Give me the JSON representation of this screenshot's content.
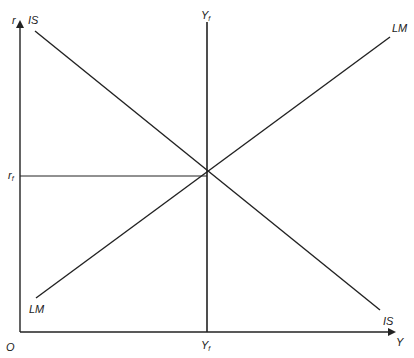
{
  "diagram": {
    "type": "IS-LM diagram",
    "axes": {
      "y_label": "r",
      "x_label": "Y",
      "origin_label": "O"
    },
    "curves": {
      "is_top_label": "IS",
      "is_bottom_label": "IS",
      "lm_top_label": "LM",
      "lm_bottom_label": "LM"
    },
    "full_employment": {
      "top_label": "Y",
      "top_sub": "f",
      "bottom_label": "Y",
      "bottom_sub": "f"
    },
    "interest_rate": {
      "label": "r",
      "sub": "f"
    },
    "colors": {
      "line": "#222222",
      "background": "#ffffff"
    }
  }
}
